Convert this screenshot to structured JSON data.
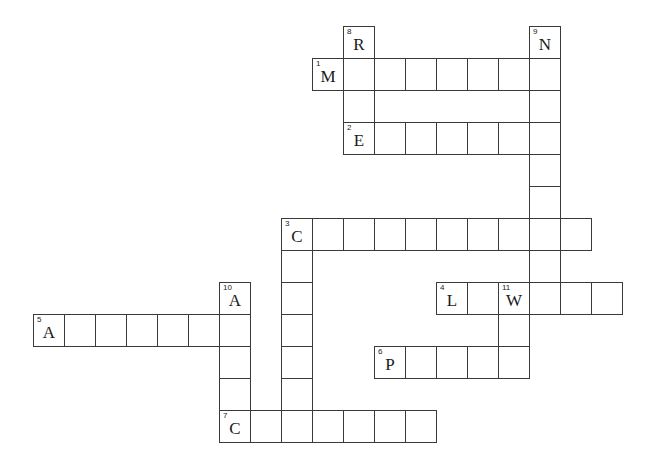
{
  "puzzle": {
    "type": "crossword",
    "grid": {
      "origin_x": 33,
      "origin_y": 26,
      "cell_w": 31,
      "cell_h": 32,
      "line_color": "#3a3a3a",
      "background": "#ffffff"
    },
    "entries": [
      {
        "number": "1",
        "direction": "across",
        "first_letter": "M",
        "row": 1,
        "col": 9,
        "length": 8
      },
      {
        "number": "2",
        "direction": "across",
        "first_letter": "E",
        "row": 3,
        "col": 10,
        "length": 7
      },
      {
        "number": "3",
        "direction": "across",
        "first_letter": "C",
        "row": 6,
        "col": 8,
        "length": 10
      },
      {
        "number": "4",
        "direction": "across",
        "first_letter": "L",
        "row": 8,
        "col": 13,
        "length": 6
      },
      {
        "number": "5",
        "direction": "across",
        "first_letter": "A",
        "row": 9,
        "col": 0,
        "length": 7
      },
      {
        "number": "6",
        "direction": "across",
        "first_letter": "P",
        "row": 10,
        "col": 11,
        "length": 5
      },
      {
        "number": "7",
        "direction": "across",
        "first_letter": "C",
        "row": 12,
        "col": 6,
        "length": 7
      },
      {
        "number": "3",
        "direction": "down",
        "first_letter": "C",
        "row": 6,
        "col": 8,
        "length": 7
      },
      {
        "number": "8",
        "direction": "down",
        "first_letter": "R",
        "row": 0,
        "col": 10,
        "length": 4
      },
      {
        "number": "9",
        "direction": "down",
        "first_letter": "N",
        "row": 0,
        "col": 16,
        "length": 9
      },
      {
        "number": "10",
        "direction": "down",
        "first_letter": "A",
        "row": 8,
        "col": 6,
        "length": 5
      },
      {
        "number": "11",
        "direction": "down",
        "first_letter": "W",
        "row": 8,
        "col": 15,
        "length": 3
      }
    ]
  }
}
